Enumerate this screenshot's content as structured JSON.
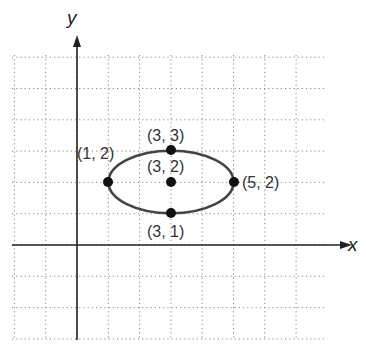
{
  "chart_data": {
    "type": "diagram",
    "title": "",
    "xlabel": "x",
    "ylabel": "y",
    "grid": true,
    "xlim": [
      -2,
      8
    ],
    "ylim": [
      -3,
      6
    ],
    "shape": {
      "kind": "ellipse",
      "center": [
        3,
        2
      ],
      "semi_major_x": 2,
      "semi_minor_y": 1
    },
    "points": [
      {
        "label": "(3, 3)",
        "x": 3,
        "y": 3
      },
      {
        "label": "(3, 2)",
        "x": 3,
        "y": 2
      },
      {
        "label": "(1, 2)",
        "x": 1,
        "y": 2
      },
      {
        "label": "(5, 2)",
        "x": 5,
        "y": 2
      },
      {
        "label": "(3, 1)",
        "x": 3,
        "y": 1
      }
    ]
  },
  "colors": {
    "axis": "#222222",
    "grid": "#888888",
    "ellipse": "#444444",
    "point": "#111111"
  }
}
